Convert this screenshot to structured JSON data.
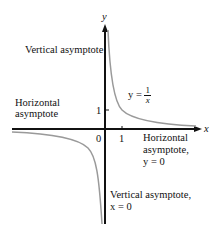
{
  "figure": {
    "axes": {
      "x_label": "x",
      "y_label": "y",
      "origin_label": "0",
      "x_tick_label": "1",
      "y_tick_label": "1"
    },
    "curve": {
      "equation_lhs": "y =",
      "equation_num": "1",
      "equation_den": "x",
      "color": "#9a9a9a"
    },
    "annotations": {
      "vertical_top": "Vertical asymptote",
      "horizontal_left_line1": "Horizontal",
      "horizontal_left_line2": "asymptote",
      "horizontal_right_line1": "Horizontal",
      "horizontal_right_line2": "asymptote,",
      "horizontal_right_line3": "y = 0",
      "vertical_bottom_line1": "Vertical asymptote,",
      "vertical_bottom_line2": "x = 0"
    },
    "axis_color": "#111111"
  }
}
